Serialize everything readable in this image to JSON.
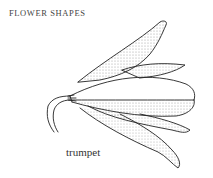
{
  "header": {
    "title": "FLOWER SHAPES"
  },
  "illustration": {
    "subject": "trumpet-flower-icon",
    "caption": "trumpet"
  }
}
